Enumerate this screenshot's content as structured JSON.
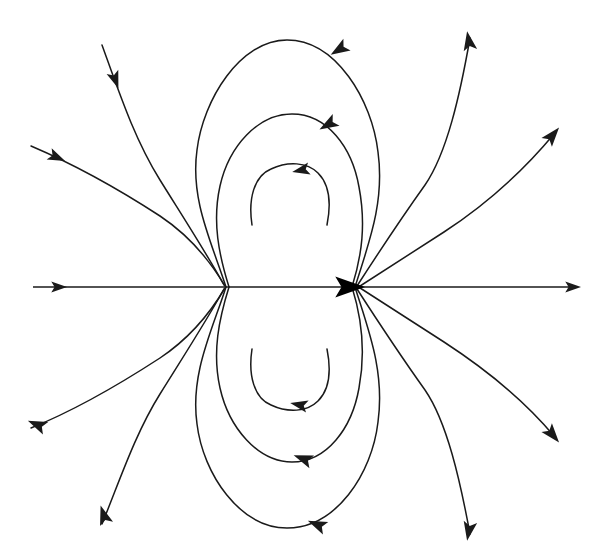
{
  "figure": {
    "title": "Electric dipole field lines",
    "width": 595,
    "height": 558,
    "background_color": "#ffffff",
    "stroke_color": "#1a1a1a",
    "stroke_width": 1.5
  },
  "chart_data": {
    "type": "line",
    "title": "Electric dipole field lines",
    "subtitle": "",
    "xlabel": "",
    "ylabel": "",
    "grid": false,
    "legend": false,
    "xlim": [
      0,
      595
    ],
    "ylim": [
      0,
      558
    ],
    "poles": [
      {
        "name": "left-pole",
        "x": 226,
        "y": 287,
        "role": "convergence-point"
      },
      {
        "name": "right-pole",
        "x": 355,
        "y": 287,
        "role": "convergence-point"
      }
    ],
    "series": [
      {
        "name": "axis-left-segment",
        "kind": "straight",
        "path": "M 33 287 L 226 287",
        "arrows": [
          {
            "x": 58,
            "y": 287,
            "angle": 0,
            "size": 9
          }
        ]
      },
      {
        "name": "axis-center-segment",
        "kind": "straight",
        "path": "M 226 287 L 355 287",
        "arrows": [
          {
            "x": 348,
            "y": 287,
            "angle": 0,
            "size": 17
          }
        ]
      },
      {
        "name": "axis-right-segment",
        "kind": "straight",
        "path": "M 355 287 L 573 287",
        "arrows": [
          {
            "x": 572,
            "y": 287,
            "angle": 0,
            "size": 9
          }
        ]
      },
      {
        "name": "loop-top-outer",
        "kind": "closed-loop",
        "path": "M 226 287 C 212 243 190 200 197 150 C 203 100 240 40 287 40 C 336 40 372 100 378 152 C 385 203 368 245 355 287",
        "arrows": [
          {
            "x": 340,
            "y": 49,
            "angle": 148,
            "size": 11
          }
        ]
      },
      {
        "name": "loop-top-middle",
        "kind": "closed-loop",
        "path": "M 229 287 C 219 255 212 222 220 186 C 229 146 258 114 292 114 C 327 114 352 147 359 187 C 366 224 362 255 352 287",
        "arrows": [
          {
            "x": 329,
            "y": 124,
            "angle": 150,
            "size": 11
          }
        ]
      },
      {
        "name": "loop-top-inner",
        "kind": "open-arc",
        "path": "M 252 225 C 248 199 254 176 271 169 C 288 161 307 162 318 173 C 330 185 331 205 327 225",
        "arrows": [
          {
            "x": 302,
            "y": 170,
            "angle": 168,
            "size": 10
          }
        ]
      },
      {
        "name": "loop-bottom-outer",
        "kind": "closed-loop",
        "path": "M 226 287 C 212 331 190 374 197 424 C 203 474 240 528 287 528 C 336 528 372 474 378 422 C 385 371 368 329 355 287",
        "arrows": [
          {
            "x": 318,
            "y": 525,
            "angle": 203,
            "size": 11
          }
        ]
      },
      {
        "name": "loop-bottom-middle",
        "kind": "closed-loop",
        "path": "M 229 287 C 219 319 212 352 220 388 C 229 428 258 462 292 462 C 327 462 352 428 359 388 C 366 351 362 319 352 287",
        "arrows": [
          {
            "x": 304,
            "y": 459,
            "angle": 200,
            "size": 11
          }
        ]
      },
      {
        "name": "loop-bottom-inner",
        "kind": "open-arc",
        "path": "M 252 349 C 248 375 254 398 271 405 C 288 413 307 412 318 401 C 330 389 331 369 327 349",
        "arrows": [
          {
            "x": 300,
            "y": 405,
            "angle": 192,
            "size": 10
          }
        ]
      },
      {
        "name": "radial-upper-left-steep",
        "kind": "open-curve",
        "direction": "inward",
        "path": "M 102 45 C 120 95 135 140 160 180 C 183 217 207 254 224 285",
        "arrows": [
          {
            "x": 115,
            "y": 79,
            "angle": 70,
            "size": 10
          }
        ]
      },
      {
        "name": "radial-upper-left-shallow",
        "kind": "open-curve",
        "direction": "inward",
        "path": "M 31 146 C 78 166 120 190 160 216 C 190 236 212 264 225 286",
        "arrows": [
          {
            "x": 56,
            "y": 157,
            "angle": 24,
            "size": 10
          }
        ]
      },
      {
        "name": "radial-upper-right-steep",
        "kind": "open-curve",
        "direction": "outward",
        "path": "M 357 286 C 377 255 400 220 425 185 C 447 153 460 95 470 38",
        "arrows": [
          {
            "x": 469,
            "y": 42,
            "angle": -100,
            "size": 11
          }
        ]
      },
      {
        "name": "radial-upper-right-shallow",
        "kind": "open-curve",
        "direction": "outward",
        "path": "M 357 288 C 385 270 413 252 444 232 C 487 204 524 170 554 134",
        "arrows": [
          {
            "x": 552,
            "y": 136,
            "angle": -50,
            "size": 11
          }
        ]
      },
      {
        "name": "radial-lower-left-steep",
        "kind": "open-curve",
        "direction": "outward",
        "path": "M 224 289 C 207 320 183 357 160 394 C 135 434 120 480 102 524",
        "arrows": [
          {
            "x": 104,
            "y": 516,
            "angle": -108,
            "size": 11
          }
        ]
      },
      {
        "name": "radial-lower-left-shallow",
        "kind": "open-curve",
        "direction": "outward",
        "path": "M 225 288 C 212 310 190 338 160 358 C 120 384 78 409 31 428",
        "arrows": [
          {
            "x": 38,
            "y": 425,
            "angle": -157,
            "size": 11
          }
        ]
      },
      {
        "name": "radial-lower-right-steep",
        "kind": "open-curve",
        "direction": "outward",
        "path": "M 357 289 C 377 320 400 355 425 390 C 447 422 460 480 470 534",
        "arrows": [
          {
            "x": 469,
            "y": 530,
            "angle": 100,
            "size": 11
          }
        ]
      },
      {
        "name": "radial-lower-right-shallow",
        "kind": "open-curve",
        "direction": "outward",
        "path": "M 357 286 C 385 304 413 322 444 342 C 487 370 524 400 554 436",
        "arrows": [
          {
            "x": 552,
            "y": 434,
            "angle": 50,
            "size": 11
          }
        ]
      }
    ]
  }
}
